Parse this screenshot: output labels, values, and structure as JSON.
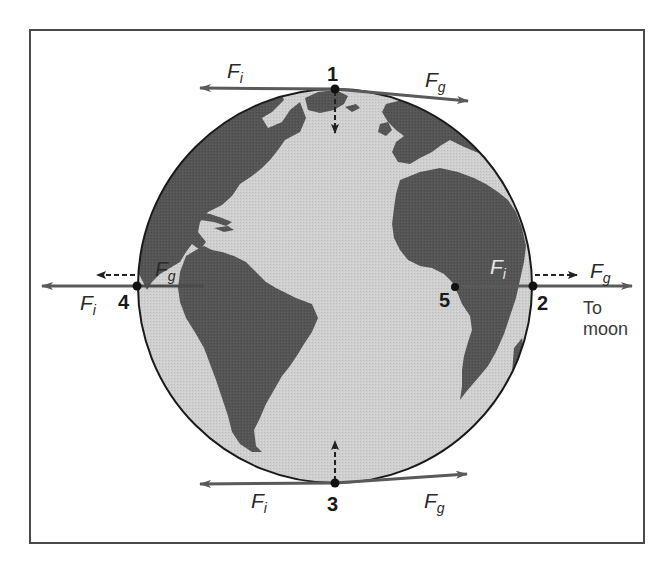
{
  "diagram": {
    "colors": {
      "frame": "#4a4a4a",
      "ocean": "#cfcfcf",
      "land": "#545454",
      "arrow": "#5a5a5a",
      "point": "#111111",
      "text": "#2a2a2a"
    },
    "points": [
      {
        "id": "1",
        "label": "1",
        "x": 335,
        "y": 89
      },
      {
        "id": "2",
        "label": "2",
        "x": 533,
        "y": 286
      },
      {
        "id": "3",
        "label": "3",
        "x": 335,
        "y": 483
      },
      {
        "id": "4",
        "label": "4",
        "x": 137,
        "y": 286
      },
      {
        "id": "5",
        "label": "5",
        "x": 455,
        "y": 287
      }
    ],
    "labels": {
      "fi_symbol": "F",
      "fi_sub": "i",
      "fg_symbol": "F",
      "fg_sub": "g",
      "to_moon_line1": "To",
      "to_moon_line2": "moon",
      "p1": "1",
      "p2": "2",
      "p3": "3",
      "p4": "4",
      "p5": "5"
    },
    "forces": [
      {
        "point": "1",
        "name": "F_i",
        "direction": "left",
        "style": "solid"
      },
      {
        "point": "1",
        "name": "F_g",
        "direction": "right-down",
        "style": "solid"
      },
      {
        "point": "1",
        "name": "net",
        "direction": "down",
        "style": "dashed"
      },
      {
        "point": "2",
        "name": "F_i",
        "direction": "left",
        "style": "solid"
      },
      {
        "point": "2",
        "name": "F_g",
        "direction": "right",
        "style": "solid"
      },
      {
        "point": "2",
        "name": "net",
        "direction": "right",
        "style": "dashed"
      },
      {
        "point": "3",
        "name": "F_i",
        "direction": "left",
        "style": "solid"
      },
      {
        "point": "3",
        "name": "F_g",
        "direction": "right-up",
        "style": "solid"
      },
      {
        "point": "3",
        "name": "net",
        "direction": "up",
        "style": "dashed"
      },
      {
        "point": "4",
        "name": "F_i",
        "direction": "left",
        "style": "solid"
      },
      {
        "point": "4",
        "name": "F_g",
        "direction": "right",
        "style": "solid"
      },
      {
        "point": "4",
        "name": "net",
        "direction": "left",
        "style": "dashed"
      }
    ]
  }
}
